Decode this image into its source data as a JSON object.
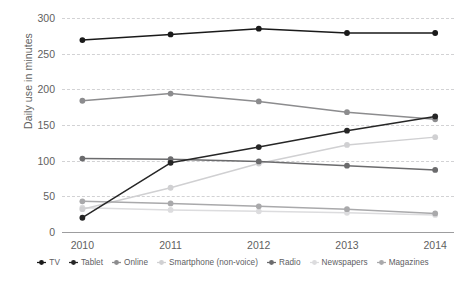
{
  "chart_data": {
    "type": "line",
    "title": "",
    "xlabel": "",
    "ylabel": "Daily use in minutes",
    "categories": [
      "2010",
      "2011",
      "2012",
      "2013",
      "2014"
    ],
    "x": [
      2010,
      2011,
      2012,
      2013,
      2014
    ],
    "ylim": [
      0,
      300
    ],
    "yticks": [
      "0",
      "50",
      "100",
      "150",
      "200",
      "250",
      "300"
    ],
    "ytick_values": [
      0,
      50,
      100,
      150,
      200,
      250,
      300
    ],
    "grid": true,
    "legend_position": "bottom",
    "series": [
      {
        "name": "TV",
        "values": [
          269,
          277,
          285,
          279,
          279
        ],
        "color": "#1a1a1a"
      },
      {
        "name": "Tablet",
        "values": [
          20,
          97,
          119,
          142,
          162
        ],
        "color": "#262626"
      },
      {
        "name": "Online",
        "values": [
          184,
          194,
          183,
          168,
          158
        ],
        "color": "#8c8c8e"
      },
      {
        "name": "Smartphone (non-voice)",
        "values": [
          32,
          62,
          96,
          122,
          133
        ],
        "color": "#d0d0d2"
      },
      {
        "name": "Radio",
        "values": [
          103,
          102,
          99,
          93,
          87
        ],
        "color": "#6b6b6d"
      },
      {
        "name": "Newspapers",
        "values": [
          34,
          31,
          29,
          27,
          24
        ],
        "color": "#dcdcde"
      },
      {
        "name": "Magazines",
        "values": [
          43,
          40,
          36,
          32,
          26
        ],
        "color": "#a9a9ab"
      }
    ]
  },
  "axis": {
    "y_title": "Daily use in minutes"
  },
  "legend": {
    "items": [
      {
        "label": "TV"
      },
      {
        "label": "Tablet"
      },
      {
        "label": "Online"
      },
      {
        "label": "Smartphone (non-voice)"
      },
      {
        "label": "Radio"
      },
      {
        "label": "Newspapers"
      },
      {
        "label": "Magazines"
      }
    ]
  }
}
